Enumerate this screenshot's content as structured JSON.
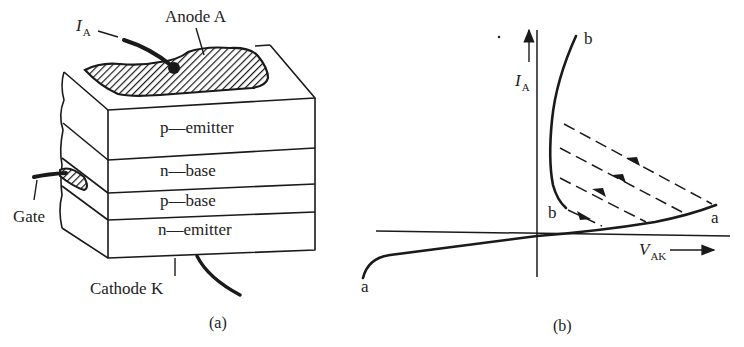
{
  "figure_a": {
    "caption": "(a)",
    "anode_label": "Anode A",
    "current_label": {
      "symbol": "I",
      "subscript": "A"
    },
    "gate_label": "Gate",
    "cathode_label": "Cathode K",
    "layers": [
      {
        "label": "p—emitter"
      },
      {
        "label": "n—base"
      },
      {
        "label": "p—base"
      },
      {
        "label": "n—emitter"
      }
    ]
  },
  "figure_b": {
    "caption": "(b)",
    "y_axis_label": {
      "symbol": "I",
      "subscript": "A"
    },
    "x_axis_label": {
      "symbol": "V",
      "subscript": "AK"
    },
    "point_labels": {
      "a_left": "a",
      "a_right": "a",
      "b_top": "b",
      "b_bottom": "b"
    }
  },
  "colors": {
    "background": "#ffffff",
    "ink": "#1a1a1a"
  }
}
